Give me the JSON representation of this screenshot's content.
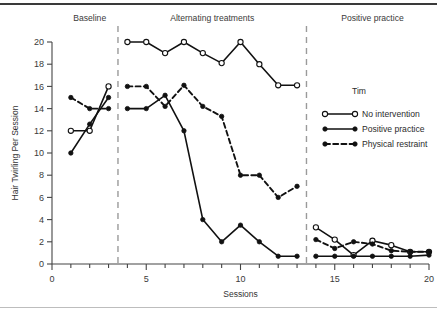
{
  "figure": {
    "y_axis_title": "Hair Twirling Per Session",
    "x_axis_title": "Sessions",
    "phases": [
      {
        "label": "Baseline",
        "x_center": 2.0
      },
      {
        "label": "Alternating treatments",
        "x_center": 8.5
      },
      {
        "label": "Positive practice",
        "x_center": 17.0
      }
    ],
    "phase_dividers": [
      3.5,
      13.5
    ],
    "legend": {
      "title": "Tim",
      "entries": [
        {
          "label": "No intervention",
          "marker": "open-circle",
          "line": "solid"
        },
        {
          "label": "Positive practice",
          "marker": "filled-circle",
          "line": "solid"
        },
        {
          "label": "Physical restraint",
          "marker": "filled-circle",
          "line": "dashed"
        }
      ]
    },
    "colors": {
      "ink": "#111111",
      "divider": "#9a9a9a",
      "axis": "#444444"
    }
  },
  "chart_data": {
    "type": "line",
    "title": "",
    "subtitle": "",
    "xlabel": "Sessions",
    "ylabel": "Hair Twirling Per Session",
    "xlim": [
      0,
      20
    ],
    "ylim": [
      0,
      20
    ],
    "xticks": [
      0,
      5,
      10,
      15,
      20
    ],
    "xtick_labels": [
      "0",
      "5",
      "10",
      "15",
      "20"
    ],
    "xminor_step": 1,
    "yticks": [
      0,
      2,
      4,
      6,
      8,
      10,
      12,
      14,
      16,
      18,
      20
    ],
    "ytick_labels": [
      "0",
      "2",
      "4",
      "6",
      "8",
      "10",
      "12",
      "14",
      "16",
      "18",
      "20"
    ],
    "grid": false,
    "legend_position": "right",
    "annotations": [
      "Baseline",
      "Alternating treatments",
      "Positive practice",
      "Tim"
    ],
    "series": [
      {
        "name": "No intervention",
        "marker": "open-circle",
        "line": "solid",
        "segments": [
          {
            "phase": "Baseline",
            "x": [
              1,
              2,
              3
            ],
            "y": [
              12,
              12,
              16
            ]
          },
          {
            "phase": "Alternating treatments",
            "x": [
              4,
              5,
              6,
              7,
              8,
              9,
              10,
              11,
              12,
              13
            ],
            "y": [
              20,
              20,
              19,
              20,
              19,
              18.1,
              20,
              18,
              16.1,
              16.1
            ]
          },
          {
            "phase": "Positive practice",
            "x": [
              14,
              15,
              16,
              17,
              18,
              19,
              20
            ],
            "y": [
              3.3,
              2.2,
              0.8,
              2.1,
              1.7,
              1.1,
              1.1
            ]
          }
        ]
      },
      {
        "name": "Positive practice",
        "marker": "filled-circle",
        "line": "solid",
        "segments": [
          {
            "phase": "Baseline",
            "x": [
              1,
              2,
              3
            ],
            "y": [
              10,
              12.6,
              15
            ]
          },
          {
            "phase": "Alternating treatments",
            "x": [
              4,
              5,
              6,
              7,
              8,
              9,
              10,
              11,
              12,
              13
            ],
            "y": [
              14,
              14,
              15.2,
              12,
              4,
              2,
              3.5,
              2,
              0.7,
              0.7
            ]
          },
          {
            "phase": "Positive practice",
            "x": [
              14,
              15,
              16,
              17,
              18,
              19,
              20
            ],
            "y": [
              0.7,
              0.7,
              0.7,
              0.7,
              0.7,
              0.7,
              0.8
            ]
          }
        ]
      },
      {
        "name": "Physical restraint",
        "marker": "filled-circle",
        "line": "dashed",
        "segments": [
          {
            "phase": "Baseline",
            "x": [
              1,
              2,
              3
            ],
            "y": [
              15,
              14,
              14
            ]
          },
          {
            "phase": "Alternating treatments",
            "x": [
              4,
              5,
              6,
              7,
              8,
              9,
              10,
              11,
              12,
              13
            ],
            "y": [
              16,
              16,
              14.2,
              16.1,
              14.2,
              13.3,
              8,
              8,
              6,
              7
            ]
          },
          {
            "phase": "Positive practice",
            "x": [
              14,
              15,
              16,
              17,
              18,
              19,
              20
            ],
            "y": [
              2.2,
              1.4,
              2.0,
              1.8,
              1.2,
              1.1,
              1.1
            ]
          }
        ]
      }
    ]
  }
}
